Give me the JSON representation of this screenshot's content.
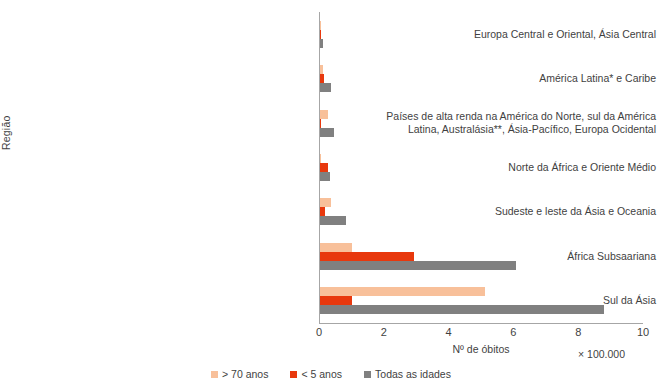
{
  "chart_data": {
    "type": "bar",
    "orientation": "horizontal",
    "title": "",
    "xlabel": "Nº de óbitos",
    "ylabel": "Região",
    "x_multiplier": "× 100.000",
    "xlim": [
      0,
      10
    ],
    "xticks": [
      0,
      2,
      4,
      6,
      8,
      10
    ],
    "xtick_labels": [
      "0",
      "2",
      "4",
      "6",
      "8",
      "10"
    ],
    "grid": false,
    "legend_position": "bottom",
    "categories": [
      "Europa Central e Oriental, Ásia Central",
      "América Latina* e Caribe",
      "Países de alta renda na América do Norte, sul da América Latina,  Australásia**, Ásia-Pacífico, Europa Ocidental",
      "Norte da África e Oriente Médio",
      "Sudeste e leste da Ásia e Oceania",
      "África Subsaariana",
      "Sul da Ásia"
    ],
    "series": [
      {
        "name": "> 70 anos",
        "color": "#F8C09A",
        "values": [
          0.02,
          0.1,
          0.25,
          0.04,
          0.35,
          1.0,
          5.1
        ]
      },
      {
        "name": "< 5 anos",
        "color": "#E8380D",
        "values": [
          0.01,
          0.12,
          0.02,
          0.25,
          0.15,
          2.9,
          1.0
        ]
      },
      {
        "name": "Todas as idades",
        "color": "#808080",
        "values": [
          0.08,
          0.35,
          0.42,
          0.3,
          0.8,
          6.05,
          8.75
        ]
      }
    ]
  },
  "legend": {
    "items": [
      {
        "label": "> 70 anos",
        "color": "#F8C09A"
      },
      {
        "label": "< 5 anos",
        "color": "#E8380D"
      },
      {
        "label": "Todas as idades",
        "color": "#808080"
      }
    ]
  },
  "axis": {
    "y_title": "Região",
    "x_title": "Nº de óbitos",
    "x_multiplier": "× 100.000"
  },
  "category_labels": [
    {
      "lines": [
        "Europa Central e Oriental, Ásia Central"
      ]
    },
    {
      "lines": [
        "América Latina* e Caribe"
      ]
    },
    {
      "lines": [
        "Países de alta renda na América do Norte, sul da América",
        "Latina,  Australásia**, Ásia-Pacífico, Europa Ocidental"
      ]
    },
    {
      "lines": [
        "Norte da África e Oriente Médio"
      ]
    },
    {
      "lines": [
        "Sudeste e leste da Ásia e Oceania"
      ]
    },
    {
      "lines": [
        "África Subsaariana"
      ]
    },
    {
      "lines": [
        "Sul da Ásia"
      ]
    }
  ]
}
